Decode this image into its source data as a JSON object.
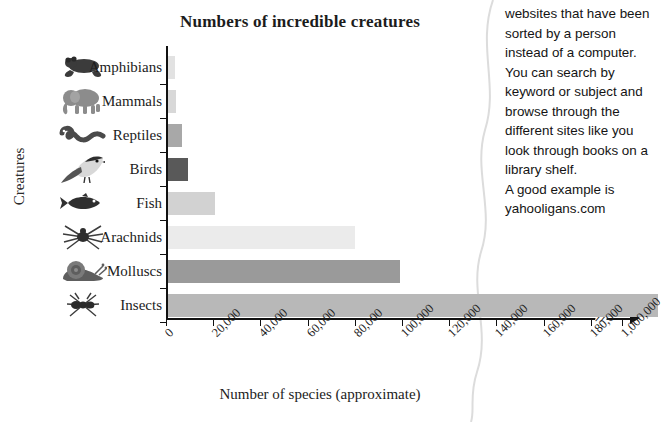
{
  "chart_data": {
    "type": "bar",
    "orientation": "horizontal",
    "title": "Numbers of incredible creatures",
    "xlabel": "Number of species (approximate)",
    "ylabel": "Creatures",
    "categories": [
      "Amphibians",
      "Mammals",
      "Reptiles",
      "Birds",
      "Fish",
      "Arachnids",
      "Molluscs",
      "Insects"
    ],
    "values": [
      4000,
      4500,
      7000,
      9500,
      21000,
      80000,
      100000,
      1000000
    ],
    "xlim": [
      0,
      1000000
    ],
    "xticks": [
      "0",
      "20,000",
      "40,000",
      "60,000",
      "80,000",
      "100,000",
      "120,000",
      "140,000",
      "160,000",
      "180,000",
      "1,000,000"
    ],
    "xtick_values": [
      0,
      20000,
      40000,
      60000,
      80000,
      100000,
      120000,
      140000,
      160000,
      180000,
      1000000
    ],
    "axis_break": true,
    "axis_break_label": "//",
    "grid": false,
    "legend": "none",
    "bar_colors": [
      "#e2e2e2",
      "#d8d8d8",
      "#a8a8a8",
      "#595959",
      "#d2d2d2",
      "#ebebeb",
      "#9a9a9a",
      "#b8b8b8"
    ],
    "bar_icons": [
      "frog-icon",
      "elephant-icon",
      "snake-icon",
      "bird-icon",
      "fish-icon",
      "spider-icon",
      "snail-icon",
      "ant-icon"
    ],
    "bar_pixel_ends": [
      175,
      176,
      182,
      188,
      215,
      355,
      400,
      658
    ]
  },
  "side_panel": {
    "paragraph": "websites that have been sorted by a person instead of a computer. You can search by keyword or subject and browse through the different sites like you look through books on a library shelf.",
    "example_line_1": "A good example is",
    "example_line_2": "yahooligans.com"
  }
}
